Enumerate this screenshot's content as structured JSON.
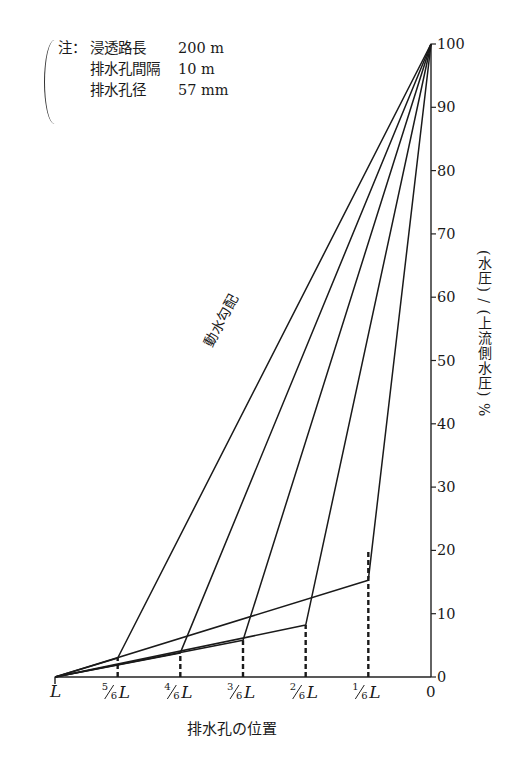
{
  "note": {
    "prefix": "注：",
    "rows": [
      {
        "key": "浸透路長",
        "value": "200 m"
      },
      {
        "key": "排水孔間隔",
        "value": "10 m"
      },
      {
        "key": "排水孔径",
        "value": "57 mm"
      }
    ]
  },
  "labels": {
    "x_title": "排水孔の位置",
    "y_title": "(水圧) / (上流側水圧)  %",
    "diagonal": "動水勾配"
  },
  "chart_data": {
    "type": "line",
    "title": "",
    "xlabel": "排水孔の位置",
    "ylabel": "(水圧)/(上流側水圧) %",
    "x_ticks": [
      "L",
      "5/6 L",
      "4/6 L",
      "3/6 L",
      "2/6 L",
      "1/6 L",
      "0"
    ],
    "x_positions_fraction_of_L": [
      1,
      0.8333,
      0.6667,
      0.5,
      0.3333,
      0.1667,
      0
    ],
    "y_ticks": [
      0,
      10,
      20,
      30,
      40,
      50,
      60,
      70,
      80,
      90,
      100
    ],
    "ylim": [
      0,
      100
    ],
    "grid": false,
    "annotations": [
      "動水勾配"
    ],
    "series": [
      {
        "name": "drain at 5/6 L",
        "points": [
          [
            1,
            0
          ],
          [
            0.8333,
            3.0
          ],
          [
            0,
            100
          ]
        ]
      },
      {
        "name": "drain at 4/6 L",
        "points": [
          [
            1,
            0
          ],
          [
            0.6667,
            3.8
          ],
          [
            0,
            100
          ]
        ]
      },
      {
        "name": "drain at 3/6 L",
        "points": [
          [
            1,
            0
          ],
          [
            0.5,
            5.8
          ],
          [
            0,
            100
          ]
        ]
      },
      {
        "name": "drain at 2/6 L",
        "points": [
          [
            1,
            0
          ],
          [
            0.3333,
            8.2
          ],
          [
            0,
            100
          ]
        ]
      },
      {
        "name": "drain at 1/6 L",
        "points": [
          [
            1,
            0
          ],
          [
            0.1667,
            15.3
          ],
          [
            0,
            100
          ]
        ]
      }
    ],
    "drain_dashed_tops": [
      {
        "x": 0.8333,
        "y": 3.0
      },
      {
        "x": 0.6667,
        "y": 3.8
      },
      {
        "x": 0.5,
        "y": 5.8
      },
      {
        "x": 0.3333,
        "y": 8.2
      },
      {
        "x": 0.1667,
        "y": 20.0
      }
    ]
  }
}
